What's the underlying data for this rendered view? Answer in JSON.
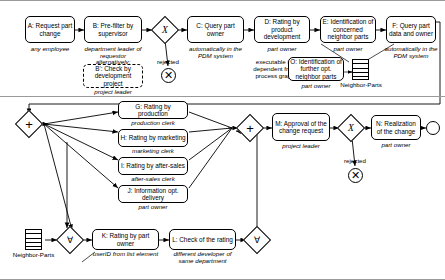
{
  "diagram": {
    "notation": "BPMN process graph"
  },
  "tasks": [
    {
      "id": "A",
      "label": "A: Request part change",
      "role": "any employee",
      "style": "solid"
    },
    {
      "id": "B",
      "label": "B: Pre-filter by supervisor",
      "role": "department leader of requestor",
      "style": "solid"
    },
    {
      "id": "Bprime",
      "label": "B': Check by development project",
      "role": "project leader",
      "style": "dashed",
      "prefix": "alternatively:"
    },
    {
      "id": "C",
      "label": "C: Query part owner",
      "role": "automatically in the PDM system",
      "style": "solid"
    },
    {
      "id": "D",
      "label": "D: Rating by product development",
      "role": "part owner",
      "style": "solid"
    },
    {
      "id": "E",
      "label": "E: Identification of concerned neighbor parts",
      "role": "part owner",
      "style": "solid"
    },
    {
      "id": "F",
      "label": "F: Query part data and owner",
      "role": "automatically in the PDM system",
      "style": "solid"
    },
    {
      "id": "O",
      "label": "O: Identification of further   opt. neighbor parts",
      "role": "part owner",
      "style": "solid",
      "note": "executable in-dependent from process graph"
    },
    {
      "id": "G",
      "label": "G: Rating by production",
      "role": "production clerk",
      "style": "solid"
    },
    {
      "id": "H",
      "label": "H: Rating by marketing",
      "role": "marketing clerk",
      "style": "solid"
    },
    {
      "id": "I",
      "label": "I: Rating by after-sales",
      "role": "after-sales clerk",
      "style": "solid"
    },
    {
      "id": "J",
      "label": "J: Information opt. delivery",
      "role": "part owner",
      "style": "solid"
    },
    {
      "id": "K",
      "label": "K: Rating by part owner",
      "role": "userID from list element",
      "style": "solid"
    },
    {
      "id": "L",
      "label": "L: Check of the rating",
      "role": "different developer of same department",
      "style": "solid"
    },
    {
      "id": "M",
      "label": "M: Approval of the change request",
      "role": "project leader",
      "style": "solid"
    },
    {
      "id": "N",
      "label": "N: Realization of the change",
      "role": "part owner",
      "style": "solid"
    }
  ],
  "gateways": [
    {
      "id": "gw-x1",
      "symbol": "X",
      "type": "exclusive"
    },
    {
      "id": "gw-split",
      "symbol": "+",
      "type": "parallel-split"
    },
    {
      "id": "gw-join",
      "symbol": "+",
      "type": "parallel-join"
    },
    {
      "id": "gw-x2",
      "symbol": "X",
      "type": "exclusive"
    },
    {
      "id": "gw-forall-left",
      "symbol": "∀",
      "type": "multi-instance"
    },
    {
      "id": "gw-forall-right",
      "symbol": "∀",
      "type": "multi-instance"
    }
  ],
  "events": [
    {
      "id": "end-rejected-1",
      "type": "terminate",
      "symbol": "✕"
    },
    {
      "id": "end-rejected-2",
      "type": "terminate",
      "symbol": "✕"
    },
    {
      "id": "end-done",
      "type": "end",
      "symbol": ""
    }
  ],
  "data_stores": [
    {
      "id": "store-top",
      "label": "Neighbor-Parts"
    },
    {
      "id": "store-bottom",
      "label": "Neighbor-Parts"
    }
  ],
  "flow_labels": [
    {
      "id": "rejected-1",
      "text": "rejected"
    },
    {
      "id": "rejected-2",
      "text": "rejected"
    }
  ],
  "colors": {
    "stroke": "#000000",
    "fill": "#ffffff",
    "frame": "#9a9a9a"
  }
}
